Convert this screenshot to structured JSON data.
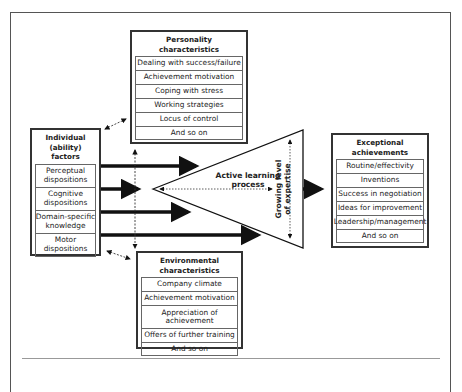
{
  "personality": {
    "title_line1": "Personality",
    "title_line2": "characteristics",
    "items": [
      "Dealing with success/failure",
      "Achievement motivation",
      "Coping with stress",
      "Working strategies",
      "Locus of control",
      "And so on"
    ]
  },
  "individual": {
    "title_line1": "Individual",
    "title_line2": "(ability) factors",
    "items": [
      {
        "l1": "Perceptual",
        "l2": "dispositions"
      },
      {
        "l1": "Cognitive",
        "l2": "dispositions"
      },
      {
        "l1": "Domain-specific",
        "l2": "knowledge"
      },
      {
        "l1": "Motor",
        "l2": "dispositions"
      }
    ]
  },
  "environmental": {
    "title_line1": "Environmental",
    "title_line2": "characteristics",
    "items": [
      "Company climate",
      "Achievement motivation",
      "Appreciation of",
      "achievement",
      "Offers of further training",
      "And so on"
    ]
  },
  "center": {
    "line1": "Active learning",
    "line2": "process",
    "vertical_line1": "Growing level",
    "vertical_line2": "of expertise"
  },
  "exceptional": {
    "title_line1": "Exceptional",
    "title_line2": "achievements",
    "items": [
      "Routine/effectivity",
      "Inventions",
      "Success in negotiation",
      "Ideas for improvement",
      "Leadership/management",
      "And so on"
    ]
  }
}
